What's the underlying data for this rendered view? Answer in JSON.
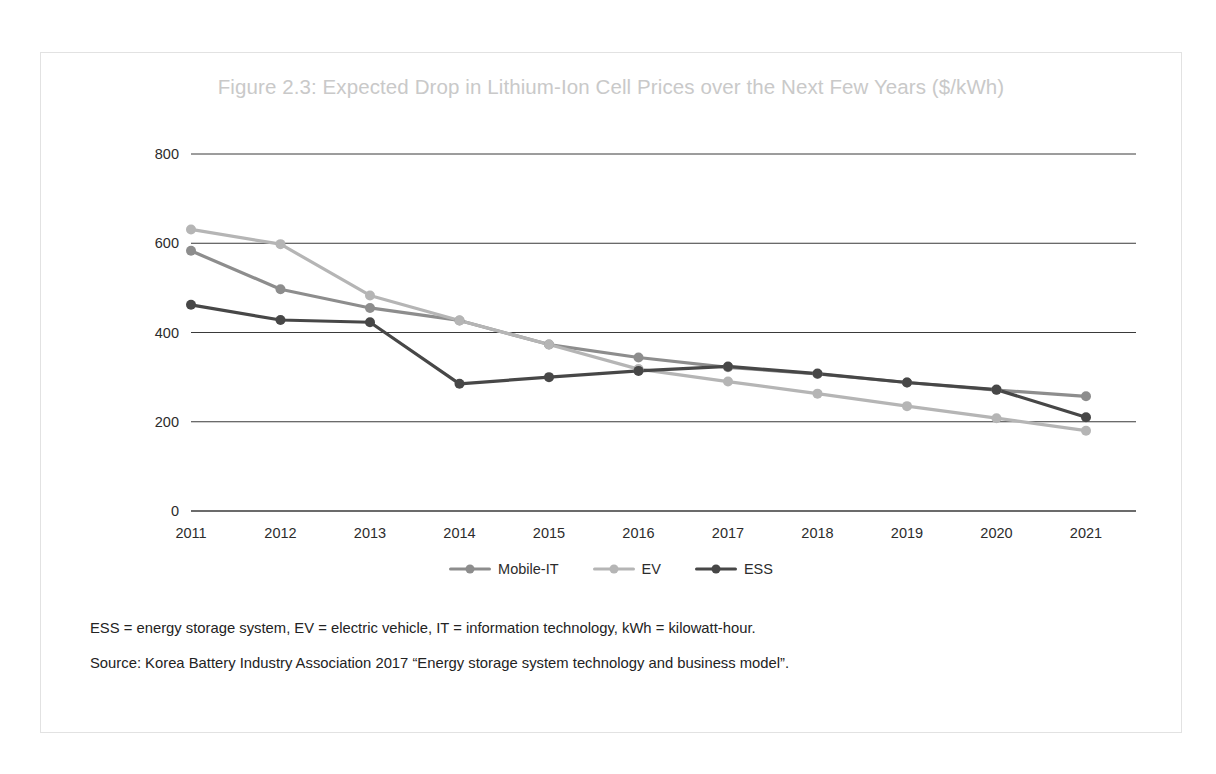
{
  "figure": {
    "title": "Figure 2.3: Expected Drop in Lithium-Ion Cell Prices over the Next Few Years ($/kWh)",
    "footnote_abbreviations": "ESS = energy storage system, EV = electric vehicle, IT = information technology, kWh = kilowatt-hour.",
    "footnote_source": "Source: Korea Battery Industry Association 2017 “Energy storage system technology and business model”."
  },
  "colors": {
    "mobile_it": "#8d8d8d",
    "ev": "#b5b5b5",
    "ess": "#474747",
    "gridline": "#3a3a3a",
    "axis": "#3a3a3a",
    "title": "#c9c9c9",
    "frame": "#e2e2e2",
    "text": "#2c2c2c"
  },
  "chart_data": {
    "type": "line",
    "title": "Figure 2.3: Expected Drop in Lithium-Ion Cell Prices over the Next Few Years ($/kWh)",
    "xlabel": "",
    "ylabel": "",
    "unit": "$/kWh",
    "categories": [
      "2011",
      "2012",
      "2013",
      "2014",
      "2015",
      "2016",
      "2017",
      "2018",
      "2019",
      "2020",
      "2021"
    ],
    "x_tick_labels": [
      "2011",
      "2012",
      "2013",
      "2014",
      "2015",
      "2016",
      "2017",
      "2018",
      "2019",
      "2020",
      "2021"
    ],
    "y_tick_labels": [
      "0",
      "200",
      "400",
      "600",
      "800"
    ],
    "y_ticks": [
      0,
      200,
      400,
      600,
      800
    ],
    "ylim": [
      0,
      800
    ],
    "grid": "horizontal",
    "legend_position": "bottom",
    "markers": true,
    "series": [
      {
        "name": "Mobile-IT",
        "color": "#8d8d8d",
        "values": [
          583,
          497,
          455,
          427,
          373,
          344,
          322,
          307,
          288,
          271,
          257
        ]
      },
      {
        "name": "EV",
        "color": "#b5b5b5",
        "values": [
          631,
          598,
          483,
          427,
          373,
          318,
          290,
          263,
          235,
          208,
          180
        ]
      },
      {
        "name": "ESS",
        "color": "#474747",
        "values": [
          462,
          428,
          423,
          285,
          300,
          314,
          324,
          308,
          288,
          272,
          210
        ]
      }
    ]
  }
}
